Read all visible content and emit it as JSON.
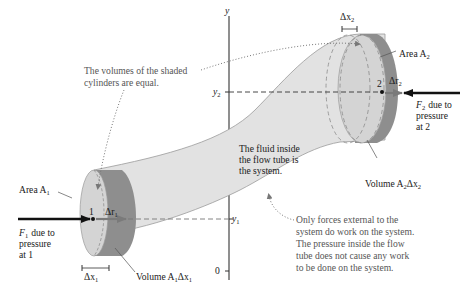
{
  "diagram": {
    "axis": {
      "name": "y",
      "origin_label": "0",
      "level_1_label": "y",
      "level_1_sub": "1",
      "level_2_label": "y",
      "level_2_sub": "2"
    },
    "annotations": {
      "volumes_equal": [
        "The volumes of the shaded",
        "cylinders are equal."
      ],
      "system": [
        "The fluid inside",
        "the flow tube is",
        "the system."
      ],
      "external_forces": [
        "Only forces external to the",
        "system do work on the system.",
        "The pressure inside the flow",
        "tube does not cause any work",
        "to be done on the system."
      ]
    },
    "point_1": {
      "number": "1",
      "area_label": "Area A",
      "area_sub": "1",
      "force_label": "F",
      "force_sub": "1",
      "force_text": [
        "due to",
        "pressure",
        "at 1"
      ],
      "displacement_label": "Δr",
      "displacement_sub": "1",
      "dx_label": "Δx",
      "dx_sub": "1",
      "volume_label": "Volume A",
      "volume_sub1": "1",
      "volume_mid": "Δx",
      "volume_sub2": "1"
    },
    "point_2": {
      "number": "2",
      "area_label": "Area A",
      "area_sub": "2",
      "force_label": "F",
      "force_sub": "2",
      "force_text": [
        "due to",
        "pressure",
        "at 2"
      ],
      "displacement_label": "Δr",
      "displacement_sub": "2",
      "dx_label": "Δx",
      "dx_sub": "2",
      "volume_label": "Volume A",
      "volume_sub1": "2",
      "volume_mid": "Δx",
      "volume_sub2": "2"
    },
    "colors": {
      "tube_fill": "#e2e2e2",
      "tube_edge": "#9a9a9a",
      "cylinder_dark": "#8e8e8e",
      "cylinder_face": "#cfcfcf",
      "force_arrow": "#111111",
      "displacement_arrow": "#777777",
      "annotation_text": "#555555"
    }
  }
}
